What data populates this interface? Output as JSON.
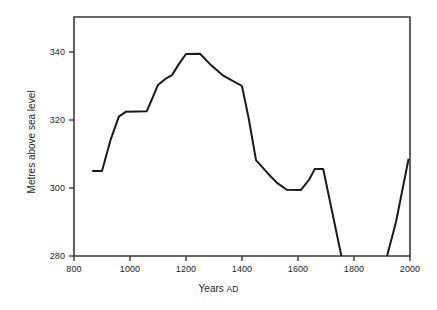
{
  "chart_data": {
    "type": "line",
    "title": "",
    "subtitle": "",
    "xlabel": "Years AD",
    "xlabel_parts": {
      "main": "Years ",
      "small": "AD"
    },
    "ylabel": "Metres above sea level",
    "xlim": [
      800,
      2000
    ],
    "ylim": [
      280,
      348
    ],
    "xticks": [
      800,
      1000,
      1200,
      1400,
      1600,
      1800,
      2000
    ],
    "xtick_labels": [
      "800",
      "1000",
      "1200",
      "1400",
      "1600",
      "1800",
      "2000"
    ],
    "yticks": [
      280,
      300,
      320,
      340
    ],
    "ytick_labels": [
      "280",
      "300",
      "320",
      "340"
    ],
    "grid": false,
    "legend": false,
    "legend_position": "none",
    "line_color": "#1a1a1a",
    "line_width": 2,
    "axis_color": "#3a3a3a",
    "background_color": "#ffffff",
    "series": [
      {
        "name": "Lake level",
        "segments": [
          {
            "name": "main-record",
            "points": [
              [
                865,
                305.0
              ],
              [
                900,
                305.0
              ],
              [
                930,
                314.0
              ],
              [
                960,
                321.0
              ],
              [
                985,
                322.4
              ],
              [
                1060,
                322.6
              ],
              [
                1075,
                325.5
              ],
              [
                1100,
                330.3
              ],
              [
                1125,
                332.0
              ],
              [
                1150,
                333.2
              ],
              [
                1175,
                336.5
              ],
              [
                1200,
                339.4
              ],
              [
                1250,
                339.5
              ],
              [
                1285,
                336.5
              ],
              [
                1330,
                333.2
              ],
              [
                1365,
                331.6
              ],
              [
                1400,
                330.0
              ],
              [
                1425,
                320.0
              ],
              [
                1450,
                308.2
              ],
              [
                1490,
                304.5
              ],
              [
                1525,
                301.5
              ],
              [
                1560,
                299.5
              ],
              [
                1610,
                299.4
              ],
              [
                1640,
                302.5
              ],
              [
                1660,
                305.6
              ],
              [
                1690,
                305.6
              ],
              [
                1755,
                280.0
              ]
            ]
          },
          {
            "name": "modern-record",
            "points": [
              [
                1918,
                280.0
              ],
              [
                1950,
                290.0
              ],
              [
                1995,
                308.6
              ]
            ]
          }
        ]
      }
    ]
  },
  "axes": {
    "frame_left": 74,
    "frame_right": 410,
    "frame_top": 17,
    "frame_bottom": 256
  }
}
